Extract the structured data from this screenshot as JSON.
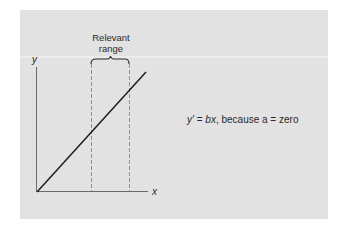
{
  "diagram": {
    "range_label_line1": "Relevant",
    "range_label_line2": "range",
    "y_axis_label": "y",
    "x_axis_label": "x",
    "equation": {
      "lhs": "y'",
      "equals": " = ",
      "term": "bx",
      "rest": ", because a = zero"
    },
    "colors": {
      "panel": "#e2e2e2",
      "line": "#1e1e1e",
      "axis": "#6a6a6a",
      "dashed": "#7a7a7a"
    }
  }
}
